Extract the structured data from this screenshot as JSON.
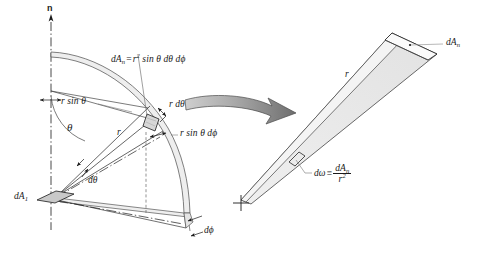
{
  "figure": {
    "background_color": "#ffffff",
    "line_color": "#1a1a1a",
    "shade_color": "#e8e8e8",
    "arrow_color": "#8c8c8c"
  },
  "left_panel": {
    "axis_label": "n",
    "area_formula": {
      "lhs": "dA",
      "lhs_sub": "n",
      "equals": "=",
      "rhs_r": "r",
      "rhs_exp": "2",
      "rhs_rest": "sin θ dθ dϕ"
    },
    "labels": {
      "r_sin_theta": "r sin θ",
      "theta": "θ",
      "r": "r",
      "r_dtheta": "r dθ",
      "r_sin_theta_dphi": "r sin θ dϕ",
      "d_theta": "dθ",
      "d_phi": "dϕ",
      "dA1": "dA",
      "dA1_sub": "1"
    }
  },
  "right_panel": {
    "labels": {
      "dAn": "dA",
      "dAn_sub": "n",
      "r": "r"
    },
    "omega_formula": {
      "lhs": "dω",
      "equals": "≡",
      "numerator": "dA",
      "numerator_sub": "n",
      "denominator": "r",
      "denominator_exp": "2"
    }
  },
  "transition_arrow": {
    "name": "magnification-arrow",
    "direction": "left-to-right"
  }
}
